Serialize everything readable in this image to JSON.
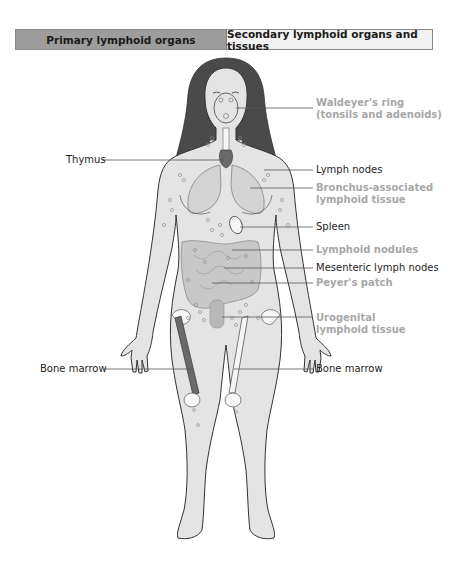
{
  "header": {
    "primary_label": "Primary lymphoid organs",
    "secondary_label": "Secondary lymphoid organs and tissues",
    "colors": {
      "primary_bg": "#9d9d9d",
      "secondary_bg": "#f2f2f2"
    }
  },
  "labels": {
    "left": [
      {
        "id": "thymus",
        "text": "Thymus",
        "category": "primary"
      },
      {
        "id": "bone-marrow-left",
        "text": "Bone marrow",
        "category": "primary"
      }
    ],
    "right": [
      {
        "id": "waldeyers-ring",
        "line1": "Waldeyer's ring",
        "line2": "(tonsils and adenoids)",
        "category": "secondary"
      },
      {
        "id": "lymph-nodes",
        "text": "Lymph nodes",
        "category": "secondary-dark"
      },
      {
        "id": "bronchus-associated",
        "line1": "Bronchus-associated",
        "line2": "lymphoid tissue",
        "category": "secondary"
      },
      {
        "id": "spleen",
        "text": "Spleen",
        "category": "secondary-dark"
      },
      {
        "id": "lymphoid-nodules",
        "text": "Lymphoid nodules",
        "category": "secondary"
      },
      {
        "id": "mesenteric-lymph-nodes",
        "text": "Mesenteric lymph nodes",
        "category": "secondary-dark"
      },
      {
        "id": "peyers-patch",
        "text": "Peyer's patch",
        "category": "secondary"
      },
      {
        "id": "urogenital",
        "line1": "Urogenital",
        "line2": "lymphoid tissue",
        "category": "secondary"
      },
      {
        "id": "bone-marrow-right",
        "text": "Bone marrow",
        "category": "primary"
      }
    ]
  },
  "colors": {
    "skin": "#e4e4e4",
    "hair": "#4a4a4a",
    "outline": "#333333",
    "primary_organ": "#6a6a6a",
    "secondary_text": "#a8a8a8",
    "leader_line": "#555555"
  }
}
